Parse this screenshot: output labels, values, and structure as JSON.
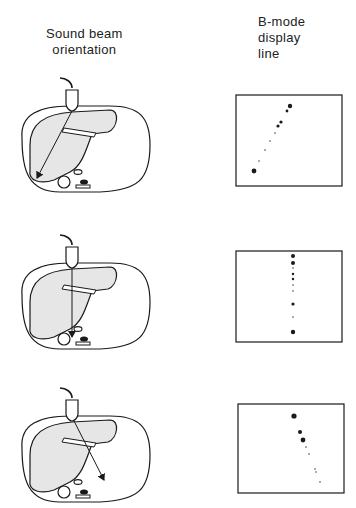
{
  "headers": {
    "left": [
      "Sound beam",
      "orientation"
    ],
    "right": [
      "B-mode",
      "display",
      "line"
    ]
  },
  "panels": [
    {
      "id": "oblique-left",
      "beam_direction": "down-left",
      "display": "diagonal line rising to upper right"
    },
    {
      "id": "vertical",
      "beam_direction": "straight-down",
      "display": "vertical line"
    },
    {
      "id": "oblique-right",
      "beam_direction": "down-right",
      "display": "diagonal line falling to lower right"
    }
  ],
  "colors": {
    "liver_fill": "#e6e6e6",
    "stroke": "#1a1a1a",
    "background": "#ffffff"
  }
}
